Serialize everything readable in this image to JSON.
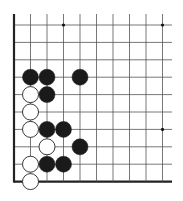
{
  "board": {
    "origin_x": 14,
    "origin_y": 25,
    "col_spacing": 16.5,
    "row_spacing": 17.4,
    "cols": 10,
    "rows": 10,
    "line_extent_right": 172,
    "line_color": "#555555",
    "edge_color": "#222222",
    "stone_radius": 8,
    "black_color": "#1a1a1a",
    "white_fill": "#ffffff",
    "white_stroke": "#222222",
    "star_points": [
      [
        3,
        0
      ],
      [
        9,
        0
      ],
      [
        9,
        6
      ]
    ],
    "stones": [
      {
        "color": "black",
        "col": 1,
        "row": 3
      },
      {
        "color": "black",
        "col": 2,
        "row": 3
      },
      {
        "color": "black",
        "col": 4,
        "row": 3
      },
      {
        "color": "white",
        "col": 1,
        "row": 4
      },
      {
        "color": "black",
        "col": 2,
        "row": 4
      },
      {
        "color": "white",
        "col": 1,
        "row": 5
      },
      {
        "color": "white",
        "col": 1,
        "row": 6
      },
      {
        "color": "black",
        "col": 2,
        "row": 6
      },
      {
        "color": "black",
        "col": 3,
        "row": 6
      },
      {
        "color": "white",
        "col": 2,
        "row": 7
      },
      {
        "color": "black",
        "col": 4,
        "row": 7
      },
      {
        "color": "white",
        "col": 1,
        "row": 8
      },
      {
        "color": "black",
        "col": 2,
        "row": 8
      },
      {
        "color": "black",
        "col": 3,
        "row": 8
      },
      {
        "color": "white",
        "col": 1,
        "row": 9
      }
    ]
  }
}
